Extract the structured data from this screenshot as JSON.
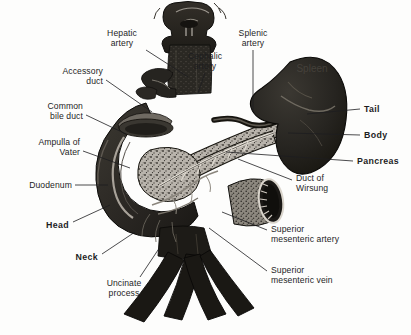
{
  "figure": {
    "background_color": "#fdfdfc",
    "ink_color": "#1d1d1f",
    "width": 411,
    "height": 335
  },
  "organ_text": {
    "spleen_overlay": "Spleen"
  },
  "labels": [
    {
      "id": "hepatic-artery",
      "text": "Hepatic\nartery",
      "align": "center",
      "bold": false,
      "x": 122,
      "y": 29,
      "leader": [
        [
          146,
          50
        ],
        [
          188,
          77
        ]
      ]
    },
    {
      "id": "accessory-duct",
      "text": "Accessory\nduct",
      "align": "right",
      "bold": false,
      "x": 103,
      "y": 67,
      "leader": [
        [
          106,
          80
        ],
        [
          152,
          112
        ]
      ]
    },
    {
      "id": "common-bile-duct",
      "text": "Common\nbile duct",
      "align": "right",
      "bold": false,
      "x": 83,
      "y": 102,
      "leader": [
        [
          86,
          115
        ],
        [
          126,
          134
        ]
      ]
    },
    {
      "id": "ampulla-of-vater",
      "text": "Ampulla of\nVater",
      "align": "right",
      "bold": false,
      "x": 80,
      "y": 138,
      "leader": [
        [
          83,
          151
        ],
        [
          130,
          168
        ]
      ]
    },
    {
      "id": "duodenum",
      "text": "Duodenum",
      "align": "right",
      "bold": false,
      "x": 72,
      "y": 181,
      "leader": [
        [
          75,
          185
        ],
        [
          108,
          185
        ]
      ]
    },
    {
      "id": "head",
      "text": "Head",
      "align": "right",
      "bold": true,
      "x": 69,
      "y": 221,
      "leader": [
        [
          73,
          222
        ],
        [
          110,
          205
        ]
      ]
    },
    {
      "id": "neck",
      "text": "Neck",
      "align": "right",
      "bold": true,
      "x": 98,
      "y": 253,
      "leader": [
        [
          102,
          254
        ],
        [
          135,
          232
        ]
      ]
    },
    {
      "id": "uncinate-process",
      "text": "Uncinate\nprocess",
      "align": "center",
      "bold": false,
      "x": 124,
      "y": 279,
      "leader": [
        [
          140,
          277
        ],
        [
          160,
          247
        ]
      ]
    },
    {
      "id": "cephalic-artery",
      "text": "Cephalic\nartery",
      "align": "center",
      "bold": false,
      "x": 205,
      "y": 52,
      "leader": [
        [
          205,
          73
        ],
        [
          198,
          93
        ]
      ]
    },
    {
      "id": "splenic-artery",
      "text": "Splenic\nartery",
      "align": "center",
      "bold": false,
      "x": 253,
      "y": 29,
      "leader": [
        [
          253,
          50
        ],
        [
          253,
          112
        ]
      ]
    },
    {
      "id": "tail",
      "text": "Tail",
      "align": "left",
      "bold": true,
      "x": 364,
      "y": 105,
      "leader": [
        [
          360,
          109
        ],
        [
          307,
          114
        ]
      ]
    },
    {
      "id": "body",
      "text": "Body",
      "align": "left",
      "bold": true,
      "x": 364,
      "y": 131,
      "leader": [
        [
          360,
          135
        ],
        [
          288,
          133
        ]
      ]
    },
    {
      "id": "pancreas",
      "text": "Pancreas",
      "align": "left",
      "bold": true,
      "x": 357,
      "y": 157,
      "leader": [
        [
          353,
          161
        ],
        [
          226,
          152
        ]
      ]
    },
    {
      "id": "duct-of-wirsung",
      "text": "Duct of\nWirsung",
      "align": "left",
      "bold": false,
      "x": 296,
      "y": 174,
      "leader": [
        [
          292,
          180
        ],
        [
          238,
          159
        ]
      ]
    },
    {
      "id": "superior-mesenteric-artery",
      "text": "Superior\nmesenteric artery",
      "align": "left",
      "bold": false,
      "x": 271,
      "y": 225,
      "leader": [
        [
          267,
          230
        ],
        [
          222,
          212
        ]
      ]
    },
    {
      "id": "superior-mesenteric-vein",
      "text": "Superior\nmesenteric vein",
      "align": "left",
      "bold": false,
      "x": 271,
      "y": 266,
      "leader": [
        [
          267,
          271
        ],
        [
          209,
          228
        ]
      ]
    }
  ]
}
